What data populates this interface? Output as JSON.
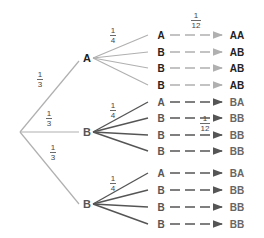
{
  "diagram": {
    "type": "probability-tree",
    "root": {
      "x": 20,
      "y": 132
    },
    "colors": {
      "light_branch": "#b0b0b0",
      "dark_branch": "#555555",
      "light_text": "#222222",
      "dark_text": "#555555",
      "fraction_text": "#444444"
    },
    "level1": [
      {
        "label": "A",
        "x": 87,
        "y": 58,
        "prob": {
          "num": "1",
          "den": "3"
        },
        "shade": "light"
      },
      {
        "label": "B",
        "x": 87,
        "y": 132,
        "prob": {
          "num": "1",
          "den": "3"
        },
        "shade": "dark"
      },
      {
        "label": "B",
        "x": 87,
        "y": 204,
        "prob": {
          "num": "1",
          "den": "3"
        },
        "shade": "dark"
      }
    ],
    "level2_prob": {
      "num": "1",
      "den": "4"
    },
    "outcome_prob": {
      "num": "1",
      "den": "12"
    },
    "groups": [
      {
        "parent": 0,
        "rows": [
          {
            "label": "A",
            "outcome": "AA",
            "y": 36
          },
          {
            "label": "B",
            "outcome": "AB",
            "y": 53
          },
          {
            "label": "B",
            "outcome": "AB",
            "y": 69
          },
          {
            "label": "B",
            "outcome": "AB",
            "y": 86
          }
        ]
      },
      {
        "parent": 1,
        "rows": [
          {
            "label": "A",
            "outcome": "BA",
            "y": 103
          },
          {
            "label": "B",
            "outcome": "BB",
            "y": 119
          },
          {
            "label": "B",
            "outcome": "BB",
            "y": 136
          },
          {
            "label": "B",
            "outcome": "BB",
            "y": 152
          }
        ]
      },
      {
        "parent": 2,
        "rows": [
          {
            "label": "A",
            "outcome": "BA",
            "y": 174
          },
          {
            "label": "B",
            "outcome": "BB",
            "y": 191
          },
          {
            "label": "B",
            "outcome": "BB",
            "y": 208
          },
          {
            "label": "B",
            "outcome": "BB",
            "y": 225
          }
        ]
      }
    ]
  }
}
